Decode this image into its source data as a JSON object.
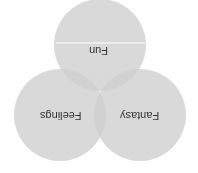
{
  "diagram": {
    "type": "venn",
    "orientation": "rotated-180",
    "circles": [
      {
        "label": "Fun",
        "cx": 100,
        "cy": 45,
        "r": 46
      },
      {
        "label": "Feelings",
        "cx": 60,
        "cy": 115,
        "r": 46
      },
      {
        "label": "Fantasy",
        "cx": 140,
        "cy": 115,
        "r": 46
      }
    ],
    "colors": {
      "circle_fill": "#c8c8c8",
      "circle_opacity": 0.75,
      "divider": "#ffffff",
      "text": "#333333"
    }
  }
}
